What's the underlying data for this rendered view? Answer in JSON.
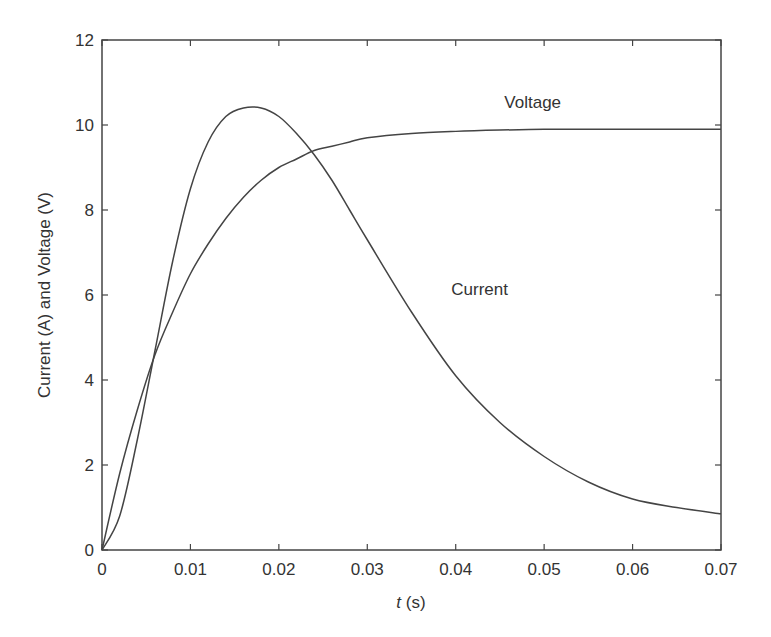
{
  "chart_data": {
    "type": "line",
    "title": "",
    "xlabel": "t (s)",
    "xlabel_italic": "t",
    "xlabel_unit": "(s)",
    "ylabel": "Current (A) and Voltage (V)",
    "xlim": [
      0,
      0.07
    ],
    "ylim": [
      0,
      12
    ],
    "xticks": [
      "0",
      "0.01",
      "0.02",
      "0.03",
      "0.04",
      "0.05",
      "0.06",
      "0.07"
    ],
    "yticks": [
      "0",
      "2",
      "4",
      "6",
      "8",
      "10",
      "12"
    ],
    "grid": false,
    "legend": "none (inline annotations)",
    "x": [
      0,
      0.002,
      0.004,
      0.006,
      0.008,
      0.01,
      0.012,
      0.014,
      0.016,
      0.018,
      0.02,
      0.022,
      0.024,
      0.026,
      0.028,
      0.03,
      0.035,
      0.04,
      0.045,
      0.05,
      0.055,
      0.06,
      0.065,
      0.07
    ],
    "series": [
      {
        "name": "Voltage",
        "values": [
          0,
          1.8,
          3.3,
          4.6,
          5.6,
          6.5,
          7.2,
          7.8,
          8.3,
          8.7,
          9.0,
          9.2,
          9.4,
          9.5,
          9.6,
          9.7,
          9.8,
          9.85,
          9.88,
          9.9,
          9.9,
          9.9,
          9.9,
          9.9
        ]
      },
      {
        "name": "Current",
        "values": [
          0,
          0.8,
          2.6,
          4.7,
          6.8,
          8.5,
          9.6,
          10.2,
          10.4,
          10.4,
          10.2,
          9.8,
          9.3,
          8.7,
          8.0,
          7.3,
          5.6,
          4.1,
          3.0,
          2.2,
          1.6,
          1.2,
          1.0,
          0.85
        ]
      }
    ],
    "annotations": [
      {
        "text": "Voltage",
        "x": 0.0455,
        "y": 10.4
      },
      {
        "text": "Current",
        "x": 0.0395,
        "y": 6.0
      }
    ]
  }
}
